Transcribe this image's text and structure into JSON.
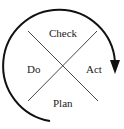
{
  "diagram": {
    "quadrants": {
      "top": "Check",
      "left": "Do",
      "right": "Act",
      "bottom": "Plan"
    },
    "arrow_direction": "clockwise",
    "colors": {
      "stroke": "#111111",
      "lines": "#333333",
      "text": "#222222"
    }
  }
}
